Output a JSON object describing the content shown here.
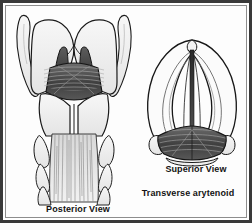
{
  "figure": {
    "kind": "anatomical-illustration",
    "style": "grayscale line drawing",
    "frame_color": "#3a3a3a",
    "background_color": "#ffffff"
  },
  "captions": {
    "posterior": "Posterior View",
    "superior": "Superior View",
    "transverse": "Transverse arytenoid"
  },
  "panels": {
    "left": {
      "name": "posterior-view-larynx",
      "label": "Posterior View",
      "structures": [
        "superior cornu of thyroid cartilage (left)",
        "superior cornu of thyroid cartilage (right)",
        "thyroid cartilage lamina",
        "arytenoid cartilages",
        "transverse arytenoid muscle",
        "oblique arytenoid fibers",
        "posterior cricoarytenoid muscle",
        "cricoid cartilage lamina",
        "inferior cornu",
        "trachea"
      ]
    },
    "right": {
      "name": "superior-view-larynx",
      "label": "Superior View",
      "structures": [
        "epiglottis",
        "aryepiglottic fold",
        "vestibular fold",
        "vocal fold",
        "glottis (rima glottidis)",
        "arytenoid cartilages",
        "transverse arytenoid muscle",
        "cuneiform tubercle",
        "corniculate tubercle"
      ]
    }
  },
  "palette": {
    "ink": "#131313",
    "outline": "#1a1a1a",
    "cartilage_fill": "#ececec",
    "cartilage_light": "#f6f6f6",
    "muscle_dark": "#4a4a4a",
    "muscle_darker": "#2e2e2e",
    "muscle_mid": "#6f6f6f",
    "fiber": "#8a8a8a",
    "shadow": "#b8b8b8"
  }
}
